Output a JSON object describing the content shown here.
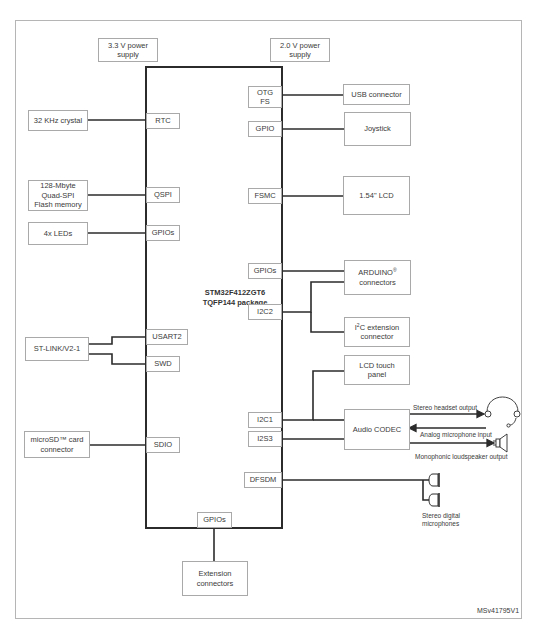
{
  "figure_id": "MSv41795V1",
  "mcu": {
    "name": "STM32F412ZGT6",
    "package": "TQFP144 package"
  },
  "power": {
    "supply_3v3": "3.3 V power\nsupply",
    "supply_2v0": "2.0 V power\nsupply"
  },
  "ports": {
    "rtc": "RTC",
    "qspi": "QSPI",
    "gpios_left": "GPIOs",
    "usart2": "USART2",
    "swd": "SWD",
    "sdio": "SDIO",
    "otg_fs": "OTG\nFS",
    "gpio": "GPIO",
    "fsmc": "FSMC",
    "gpios_right": "GPIOs",
    "i2c2": "I2C2",
    "i2c1": "I2C1",
    "i2s3": "I2S3",
    "dfsdm": "DFSDM",
    "gpios_bottom": "GPIOs"
  },
  "peripherals": {
    "crystal": "32 KHz crystal",
    "flash": "128-Mbyte\nQuad-SPI\nFlash memory",
    "leds": "4x LEDs",
    "stlink": "ST-LINK/V2-1",
    "microsd": "microSD™ card\nconnector",
    "usb": "USB connector",
    "joystick": "Joystick",
    "lcd": "1.54\" LCD",
    "arduino_main": "ARDUINO",
    "arduino_reg": "®",
    "arduino_sub": "connectors",
    "i2c_ext_prefix": "I",
    "i2c_ext_sup": "2",
    "i2c_ext_main": "C extension",
    "i2c_ext_sub": "connector",
    "lcd_touch": "LCD touch\npanel",
    "audio_codec": "Audio CODEC",
    "extension": "Extension\nconnectors"
  },
  "audio_labels": {
    "headset_out": "Stereo headset output",
    "mic_in": "Analog microphone input",
    "speaker_out": "Monophonic loudspeaker output",
    "digital_mics": "Stereo digital\nmicrophones"
  },
  "colors": {
    "wire": "#2b2b2b",
    "box_border": "#a9a9a9",
    "frame": "#b5b5b5"
  }
}
